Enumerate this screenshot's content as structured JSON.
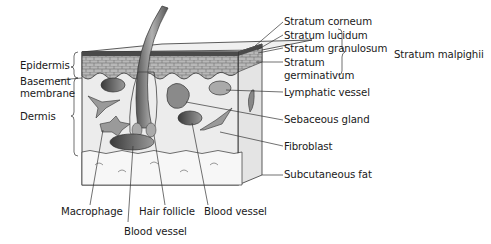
{
  "diagram": {
    "left_labels": {
      "epidermis": "Epidermis",
      "basement_membrane_line1": "Basement",
      "basement_membrane_line2": "membrane",
      "dermis": "Dermis"
    },
    "right_labels": {
      "stratum_corneum": "Stratum corneum",
      "stratum_lucidum": "Stratum lucidum",
      "stratum_granulosum": "Stratum granulosum",
      "stratum_germinativum_line1": "Stratum",
      "stratum_germinativum_line2": "germinativum",
      "stratum_malpighii": "Stratum malpighii",
      "lymphatic_vessel": "Lymphatic vessel",
      "sebaceous_gland": "Sebaceous gland",
      "fibroblast": "Fibroblast",
      "subcutaneous_fat": "Subcutaneous fat"
    },
    "bottom_labels": {
      "macrophage": "Macrophage",
      "hair_follicle": "Hair follicle",
      "blood_vessel_right": "Blood vessel",
      "blood_vessel_bottom": "Blood vessel"
    },
    "colors": {
      "line": "#333333",
      "epidermis": "#9a9a9a",
      "dermis": "#ececec",
      "fat": "#f4f4f4",
      "structure": "#7a7a7a"
    }
  }
}
